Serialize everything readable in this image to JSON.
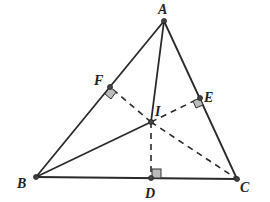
{
  "diagram": {
    "type": "triangle-incenter",
    "points": {
      "A": {
        "label": "A",
        "x": 164,
        "y": 21
      },
      "B": {
        "label": "B",
        "x": 36,
        "y": 177
      },
      "C": {
        "label": "C",
        "x": 237,
        "y": 179
      },
      "I": {
        "label": "I",
        "x": 151,
        "y": 122
      },
      "D": {
        "label": "D",
        "x": 151,
        "y": 178
      },
      "E": {
        "label": "E",
        "x": 200,
        "y": 98
      },
      "F": {
        "label": "F",
        "x": 110,
        "y": 87
      }
    },
    "solid_segments": [
      "AB",
      "BC",
      "CA",
      "AI",
      "BI"
    ],
    "dashed_segments": [
      "IF",
      "IE",
      "ID",
      "IC"
    ],
    "right_angles": [
      "F",
      "E",
      "D"
    ]
  }
}
